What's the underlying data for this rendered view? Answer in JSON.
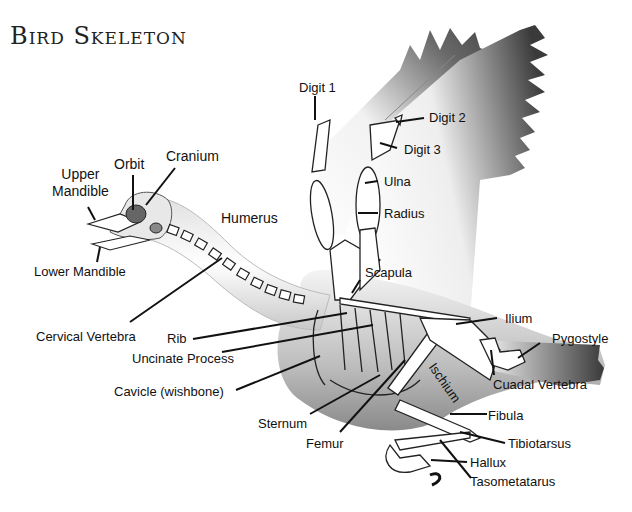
{
  "title": "Bird Skeleton",
  "labels": {
    "upper_mandible": "Upper\nMandible",
    "upper_mandible_l1": "Upper",
    "upper_mandible_l2": "Mandible",
    "orbit": "Orbit",
    "cranium": "Cranium",
    "lower_mandible": "Lower Mandible",
    "humerus": "Humerus",
    "digit1": "Digit 1",
    "digit2": "Digit 2",
    "digit3": "Digit 3",
    "ulna": "Ulna",
    "radius": "Radius",
    "scapula": "Scapula",
    "cervical_vertebra": "Cervical Vertebra",
    "rib": "Rib",
    "uncinate_process": "Uncinate Process",
    "cavicle": "Cavicle (wishbone)",
    "sternum": "Sternum",
    "femur": "Femur",
    "ilium": "Ilium",
    "pygostyle": "Pygostyle",
    "ischium": "Ischium",
    "cuadal_vertebra": "Cuadal Vertebra",
    "fibula": "Fibula",
    "tibiotarsus": "Tibiotarsus",
    "hallux": "Hallux",
    "tasometatarus": "Tasometatarus"
  },
  "colors": {
    "background": "#ffffff",
    "ink": "#111111",
    "wing_dark": "#5a5a5a",
    "body_shade": "#9a9a9a"
  }
}
